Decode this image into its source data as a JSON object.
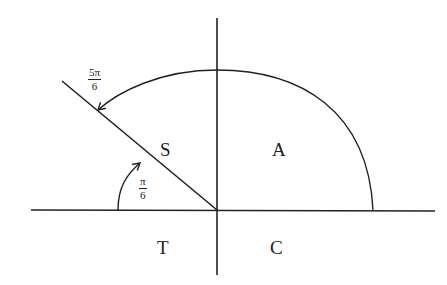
{
  "diagram": {
    "title": "",
    "type": "unit circle quadrant (ASTC) diagram",
    "quadrant_labels": {
      "q1": "A",
      "q2": "S",
      "q3": "T",
      "q4": "C"
    },
    "angles": [
      {
        "name": "large_angle",
        "numerator": "5π",
        "denominator": "6"
      },
      {
        "name": "reference_angle",
        "numerator": "π",
        "denominator": "6"
      }
    ],
    "colors": {
      "stroke": "#222222",
      "background": "#ffffff"
    }
  }
}
